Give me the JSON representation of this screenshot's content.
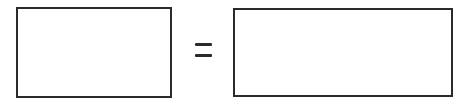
{
  "diagram": {
    "left_box": {
      "text": ""
    },
    "operator": {
      "symbol": "=",
      "label": "equals"
    },
    "right_box": {
      "text": ""
    },
    "colors": {
      "stroke": "#2b2b2b",
      "background": "#ffffff"
    }
  }
}
